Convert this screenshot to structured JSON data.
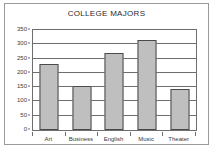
{
  "chart_data": {
    "type": "bar",
    "title": "COLLEGE MAJORS",
    "xlabel": "",
    "ylabel": "",
    "categories": [
      "Art",
      "Business",
      "English",
      "Music",
      "Theater"
    ],
    "values": [
      230,
      155,
      268,
      315,
      142
    ],
    "ylim": [
      0,
      350
    ],
    "yticks": [
      0,
      50,
      100,
      150,
      200,
      250,
      300,
      350
    ],
    "ytick_labels": [
      "0",
      "50",
      "100",
      "150",
      "200",
      "250",
      "300",
      "350"
    ],
    "grid": true,
    "legend": false,
    "legend_position": "none",
    "colors": {
      "bar_fill": "#bfbfbf",
      "bar_border": "#4a4a4a",
      "plot_border": "#6e6e6e",
      "gridline": "#6e6e6e",
      "frame_border": "#9a9a9a",
      "background": "#ffffff",
      "text": "#3a3a3a",
      "title_text": "#2b2b2b"
    }
  }
}
